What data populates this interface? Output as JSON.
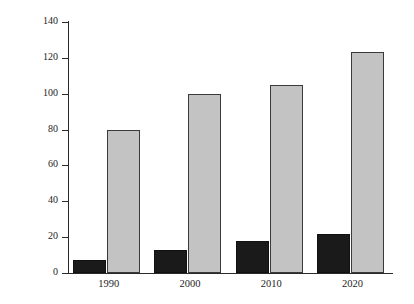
{
  "chart_data": {
    "type": "bar",
    "title": "",
    "subtitle": "",
    "xlabel": "",
    "ylabel": "Number of deaths (1000s)",
    "categories": [
      "1990",
      "2000",
      "2010",
      "2020"
    ],
    "series": [
      {
        "name": "dark-series",
        "color": "#1a1a1a",
        "values": [
          7,
          13,
          18,
          22
        ]
      },
      {
        "name": "light-series",
        "color": "#c3c3c3",
        "values": [
          80,
          100,
          105,
          123
        ]
      }
    ],
    "ylim": [
      0,
      140
    ],
    "yticks": [
      0,
      20,
      40,
      60,
      80,
      100,
      120,
      140
    ],
    "ytick_labels": [
      "0",
      "20",
      "40",
      "60",
      "80",
      "100",
      "120",
      "140"
    ],
    "grid": false,
    "legend": "none",
    "background_color": "#ffffff",
    "axis_color": "#2a2a2a"
  }
}
